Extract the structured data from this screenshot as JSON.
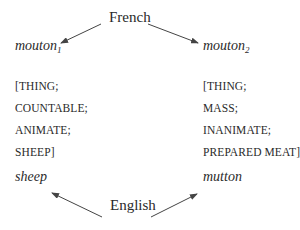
{
  "diagram": {
    "source_language": "French",
    "target_language": "English",
    "left": {
      "word": "mouton",
      "subscript": "1",
      "features": [
        "[THING;",
        "COUNTABLE;",
        "ANIMATE;",
        "SHEEP]"
      ],
      "translation": "sheep"
    },
    "right": {
      "word": "mouton",
      "subscript": "2",
      "features": [
        "[THING;",
        "MASS;",
        "INANIMATE;",
        "PREPARED MEAT]"
      ],
      "translation": "mutton"
    },
    "colors": {
      "text": "#2a2a2a",
      "arrow": "#444444"
    }
  }
}
